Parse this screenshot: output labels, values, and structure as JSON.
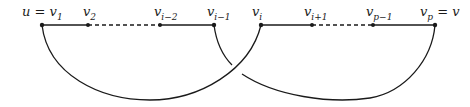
{
  "diagram": {
    "type": "path-with-crossing-arcs",
    "vertices": [
      {
        "id": "v1",
        "label_main": "u = v",
        "label_sub": "1",
        "x": 42
      },
      {
        "id": "v2",
        "label_main": "v",
        "label_sub": "2",
        "x": 88
      },
      {
        "id": "vi-2",
        "label_main": "v",
        "label_sub": "i−2",
        "x": 160
      },
      {
        "id": "vi-1",
        "label_main": "v",
        "label_sub": "i−1",
        "x": 214
      },
      {
        "id": "vi",
        "label_main": "v",
        "label_sub": "i",
        "x": 261
      },
      {
        "id": "vi+1",
        "label_main": "v",
        "label_sub": "i+1",
        "x": 312
      },
      {
        "id": "vp-1",
        "label_main": "v",
        "label_sub": "p−1",
        "x": 373
      },
      {
        "id": "vp",
        "label_main": "v",
        "label_sub": "p",
        "label_suffix": " = v",
        "x": 435
      }
    ],
    "edges": [
      {
        "from": "v1",
        "to": "v2",
        "style": "solid"
      },
      {
        "from": "v2",
        "to": "vi-2",
        "style": "dashed"
      },
      {
        "from": "vi-2",
        "to": "vi-1",
        "style": "solid"
      },
      {
        "from": "vi",
        "to": "vi+1",
        "style": "solid"
      },
      {
        "from": "vi+1",
        "to": "vp-1",
        "style": "dashed"
      },
      {
        "from": "vp-1",
        "to": "vp",
        "style": "solid"
      }
    ],
    "arcs": [
      {
        "from": "v1",
        "to": "vi",
        "layer": "over"
      },
      {
        "from": "vi-1",
        "to": "vp",
        "layer": "under"
      }
    ],
    "colors": {
      "stroke": "#1a1a1a",
      "background": "#ffffff"
    }
  }
}
